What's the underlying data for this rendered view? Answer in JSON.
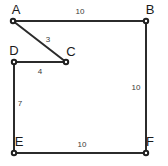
{
  "figure": {
    "type": "polygon-diagram",
    "background_color": "#ffffff",
    "stroke_color": "#2b2b2b",
    "label_color": "#1a1a1a",
    "vertices": [
      {
        "id": "A",
        "label": "A",
        "x": 13,
        "y": 21,
        "label_x": 16,
        "label_y": 14
      },
      {
        "id": "B",
        "label": "B",
        "x": 146,
        "y": 21,
        "label_x": 150,
        "label_y": 14
      },
      {
        "id": "C",
        "label": "C",
        "x": 66,
        "y": 62,
        "label_x": 71,
        "label_y": 56
      },
      {
        "id": "D",
        "label": "D",
        "x": 14,
        "y": 62,
        "label_x": 14,
        "label_y": 55
      },
      {
        "id": "E",
        "label": "E",
        "x": 14,
        "y": 153,
        "label_x": 19,
        "label_y": 146
      },
      {
        "id": "F",
        "label": "F",
        "x": 146,
        "y": 153,
        "label_x": 150,
        "label_y": 146
      }
    ],
    "edges": [
      {
        "id": "AB",
        "from": "A",
        "to": "B",
        "length_label": "10",
        "label_x": 80,
        "label_y": 14
      },
      {
        "id": "BF",
        "from": "B",
        "to": "F",
        "length_label": "10",
        "label_x": 136,
        "label_y": 90
      },
      {
        "id": "FE",
        "from": "F",
        "to": "E",
        "length_label": "10",
        "label_x": 82,
        "label_y": 147
      },
      {
        "id": "ED",
        "from": "E",
        "to": "D",
        "length_label": "7",
        "label_x": 20,
        "label_y": 106
      },
      {
        "id": "DC",
        "from": "D",
        "to": "C",
        "length_label": "4",
        "label_x": 40,
        "label_y": 74
      },
      {
        "id": "CA",
        "from": "C",
        "to": "A",
        "length_label": "3",
        "label_x": 48,
        "label_y": 42
      }
    ]
  }
}
